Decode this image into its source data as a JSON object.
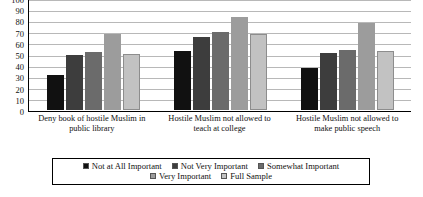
{
  "chart_data": {
    "type": "bar",
    "title": "",
    "xlabel": "",
    "ylabel": "",
    "ylim": [
      0,
      100
    ],
    "ytick_step": 10,
    "yticks": [
      0,
      10,
      20,
      30,
      40,
      50,
      60,
      70,
      80,
      90,
      100
    ],
    "grid": true,
    "legend_position": "bottom",
    "categories": [
      "Deny book of hostile Muslim in public library",
      "Hostile Muslim not allowed to teach at college",
      "Hostile Muslim not allowed to make public speech"
    ],
    "series": [
      {
        "name": "Not at All Important",
        "color": "#111111",
        "values": [
          32,
          54,
          38
        ]
      },
      {
        "name": "Not Very Important",
        "color": "#3d3d3d",
        "values": [
          50,
          66,
          52
        ]
      },
      {
        "name": "Somewhat Important",
        "color": "#6b6b6b",
        "values": [
          53,
          71,
          55
        ]
      },
      {
        "name": "Very Important",
        "color": "#9c9c9c",
        "values": [
          69,
          85,
          79
        ]
      },
      {
        "name": "Full Sample",
        "color": "#c2c2c2",
        "values": [
          51,
          69,
          54
        ]
      }
    ]
  }
}
